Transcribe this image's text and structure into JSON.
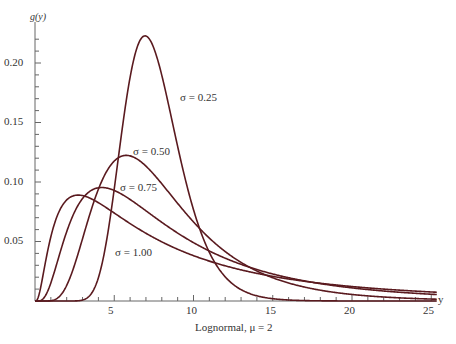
{
  "chart_data": {
    "type": "line",
    "title": "",
    "xlabel": "Lognormal, μ = 2",
    "ylabel": "g(y)",
    "x_axis_end_label": "y",
    "xlim": [
      0,
      25.5
    ],
    "ylim": [
      0,
      0.23
    ],
    "x_ticks": [
      5,
      10,
      15,
      20,
      25
    ],
    "y_ticks": [
      0.05,
      0.1,
      0.15,
      0.2
    ],
    "y_tick_labels": [
      "0.05",
      "0.10",
      "0.15",
      "0.20"
    ],
    "x_tick_labels": [
      "5",
      "10",
      "15",
      "20",
      "25"
    ],
    "grid": false,
    "legend": "inline annotations",
    "line_color": "#5a1a1f",
    "mu": 2,
    "series": [
      {
        "name": "σ = 0.25",
        "sigma": 0.25,
        "peak_x": 6.9,
        "peak_y": 0.22
      },
      {
        "name": "σ = 0.50",
        "sigma": 0.5,
        "peak_x": 5.8,
        "peak_y": 0.12
      },
      {
        "name": "σ = 0.75",
        "sigma": 0.75,
        "peak_x": 4.2,
        "peak_y": 0.095
      },
      {
        "name": "σ = 1.00",
        "sigma": 1.0,
        "peak_x": 2.7,
        "peak_y": 0.089
      }
    ],
    "annotations": [
      {
        "text": "σ = 0.25",
        "x": 9.2,
        "y": 0.172
      },
      {
        "text": "σ = 0.50",
        "x": 6.5,
        "y": 0.13
      },
      {
        "text": "σ = 0.75",
        "x": 5.5,
        "y": 0.095
      },
      {
        "text": "σ = 1.00",
        "x": 5.0,
        "y": 0.044
      }
    ]
  }
}
